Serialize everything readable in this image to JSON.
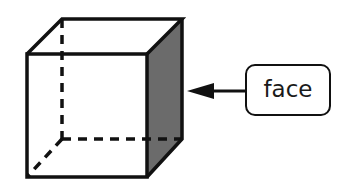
{
  "diagram": {
    "label": "face",
    "colors": {
      "stroke": "#111111",
      "shaded_face": "#6b6b6b",
      "background": "#ffffff"
    },
    "shapes": {
      "cube": {
        "front_face": [
          [
            27,
            54
          ],
          [
            147,
            54
          ],
          [
            147,
            177
          ],
          [
            27,
            177
          ]
        ],
        "top_face": [
          [
            27,
            54
          ],
          [
            62,
            19
          ],
          [
            182,
            19
          ],
          [
            147,
            54
          ]
        ],
        "right_face_shaded": [
          [
            147,
            54
          ],
          [
            182,
            19
          ],
          [
            182,
            139
          ],
          [
            147,
            177
          ]
        ],
        "hidden_edges": [
          [
            [
              62,
              19
            ],
            [
              62,
              139
            ]
          ],
          [
            [
              62,
              139
            ],
            [
              182,
              139
            ]
          ],
          [
            [
              62,
              139
            ],
            [
              27,
              177
            ]
          ]
        ]
      },
      "arrow": {
        "from": [
          245,
          91
        ],
        "to": [
          187,
          91
        ]
      }
    }
  }
}
